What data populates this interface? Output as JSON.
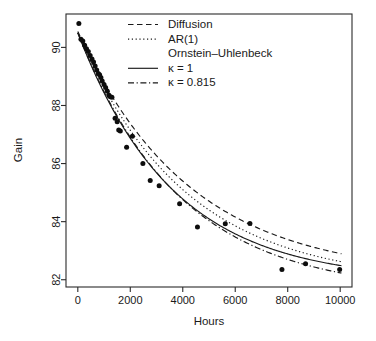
{
  "chart_data": {
    "type": "scatter",
    "title": "",
    "xlabel": "Hours",
    "ylabel": "Gain",
    "xlim": [
      -450,
      10450
    ],
    "ylim": [
      81.75,
      91.15
    ],
    "xticks": [
      0,
      2000,
      4000,
      6000,
      8000,
      10000
    ],
    "xtick_labels": [
      "0",
      "2000",
      "4000",
      "6000",
      "8000",
      "10000"
    ],
    "yticks": [
      82,
      84,
      86,
      88,
      90
    ],
    "ytick_labels": [
      "82",
      "84",
      "86",
      "88",
      "90"
    ],
    "grid": false,
    "legend_position": "top-center",
    "point_color": "#0d0d0d",
    "line_color": "#1a1a1a",
    "points": [
      [
        40,
        90.82
      ],
      [
        120,
        90.28
      ],
      [
        190,
        90.22
      ],
      [
        260,
        90.07
      ],
      [
        330,
        89.95
      ],
      [
        400,
        89.86
      ],
      [
        470,
        89.72
      ],
      [
        540,
        89.6
      ],
      [
        600,
        89.5
      ],
      [
        660,
        89.36
      ],
      [
        720,
        89.22
      ],
      [
        780,
        89.1
      ],
      [
        830,
        89.06
      ],
      [
        880,
        88.96
      ],
      [
        930,
        88.84
      ],
      [
        1000,
        88.72
      ],
      [
        1060,
        88.62
      ],
      [
        1120,
        88.5
      ],
      [
        1180,
        88.36
      ],
      [
        1240,
        88.3
      ],
      [
        1300,
        88.28
      ],
      [
        1420,
        87.56
      ],
      [
        1500,
        87.44
      ],
      [
        1560,
        87.16
      ],
      [
        1620,
        87.12
      ],
      [
        1860,
        86.56
      ],
      [
        2080,
        86.94
      ],
      [
        2480,
        86.0
      ],
      [
        2760,
        85.42
      ],
      [
        3100,
        85.24
      ],
      [
        3880,
        84.62
      ],
      [
        4560,
        83.82
      ],
      [
        5620,
        83.93
      ],
      [
        6560,
        83.94
      ],
      [
        7780,
        82.35
      ],
      [
        8680,
        82.55
      ],
      [
        9980,
        82.35
      ]
    ],
    "series": [
      {
        "name": "Diffusion",
        "style": "dashed",
        "model": "90.55 - 8.45 * (1 - exp(-x/4250))"
      },
      {
        "name": "AR(1)",
        "style": "dotted",
        "model": "90.5 - 8.6 * (1 - exp(-x/4050))"
      },
      {
        "name": "kappa = 1",
        "style": "solid",
        "model": "90.5 - 8.55 * (1 - exp(-x/3620))"
      },
      {
        "name": "kappa = 0.815",
        "style": "dashdot",
        "model": "90.5 - 8.95 * (1 - exp(-x/3900))"
      }
    ]
  },
  "legend": {
    "entries": [
      {
        "label": "Diffusion",
        "style": "dashed"
      },
      {
        "label": "AR(1)",
        "style": "dotted"
      },
      {
        "label": "Ornstein–Uhlenbeck",
        "style": "none"
      },
      {
        "label": "κ = 1",
        "style": "solid"
      },
      {
        "label": "κ = 0.815",
        "style": "dashdot"
      }
    ]
  },
  "axes": {
    "x_title": "Hours",
    "y_title": "Gain"
  }
}
